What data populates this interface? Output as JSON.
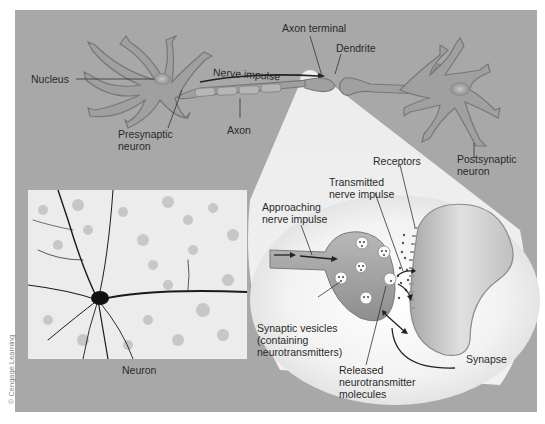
{
  "figure": {
    "credit": "© Cengage Learning",
    "colors": {
      "panel_background": "#a8a8a8",
      "neuron_fill": "#a0a0a0",
      "neuron_outline": "#7a7a7a",
      "spotlight": "#f4f4f4",
      "label_text": "#2a2a2a"
    },
    "labels": {
      "nucleus": "Nucleus",
      "nerve_impulse": "Nerve impulse",
      "axon_terminal": "Axon terminal",
      "dendrite": "Dendrite",
      "presynaptic_neuron": "Presynaptic\nneuron",
      "axon": "Axon",
      "postsynaptic_neuron": "Postsynaptic\nneuron",
      "receptors": "Receptors",
      "transmitted_nerve_impulse": "Transmitted\nnerve impulse",
      "approaching_nerve_impulse": "Approaching\nnerve impulse",
      "synaptic_vesicles": "Synaptic vesicles\n(containing\nneurotransmitters)",
      "released_neurotransmitter": "Released\nneurotransmitter\nmolecules",
      "synapse": "Synapse",
      "neuron_photo": "Neuron"
    }
  }
}
